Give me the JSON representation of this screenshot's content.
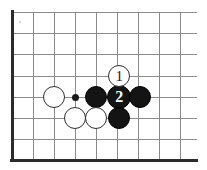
{
  "diagram": {
    "type": "go-board-corner-diagram",
    "board": {
      "grid_spacing": 21,
      "origin_x": 12,
      "origin_y": 12,
      "columns": 9,
      "rows": 7,
      "line_color": "#8a8a8a",
      "edge_color": "#2b2b2b",
      "background_color": "#ffffff",
      "edge_left": true,
      "edge_bottom": true,
      "vertical_line_x": [
        12,
        33,
        54,
        75,
        96,
        117,
        138,
        159,
        180
      ],
      "horizontal_line_y": [
        12,
        33,
        54,
        76,
        97,
        118,
        139
      ],
      "grid_right_extent": 197,
      "grid_bottom_extent": 159
    },
    "star_points": [
      {
        "name": "hoshi",
        "x": 75,
        "y": 97
      }
    ],
    "artifacts": [
      {
        "name": "scan-speck",
        "x": 19,
        "y": 21
      }
    ],
    "stones": [
      {
        "id": "w-a",
        "color": "white",
        "x": 54,
        "y": 97,
        "radius": 11,
        "label": ""
      },
      {
        "id": "b-a",
        "color": "black",
        "x": 96,
        "y": 97,
        "radius": 11,
        "label": ""
      },
      {
        "id": "b-2",
        "color": "black",
        "x": 119,
        "y": 97,
        "radius": 12,
        "label": "2"
      },
      {
        "id": "b-b",
        "color": "black",
        "x": 140,
        "y": 97,
        "radius": 11,
        "label": ""
      },
      {
        "id": "w-1",
        "color": "white",
        "x": 119,
        "y": 76,
        "radius": 11,
        "label": "1"
      },
      {
        "id": "w-b",
        "color": "white",
        "x": 75,
        "y": 118,
        "radius": 11,
        "label": ""
      },
      {
        "id": "w-c",
        "color": "white",
        "x": 96,
        "y": 118,
        "radius": 11,
        "label": ""
      },
      {
        "id": "b-c",
        "color": "black",
        "x": 119,
        "y": 118,
        "radius": 11,
        "label": ""
      }
    ],
    "colors": {
      "black_stone": "#141414",
      "white_stone": "#ffffff",
      "stone_outline": "#2e2e2e",
      "grid": "#8a8a8a",
      "edge": "#2b2b2b"
    }
  }
}
